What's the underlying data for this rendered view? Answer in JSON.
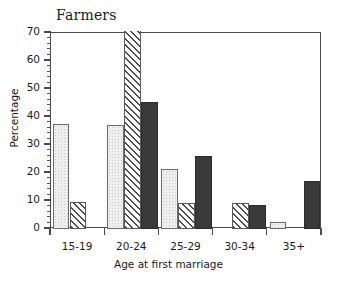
{
  "chart_data": {
    "type": "bar",
    "title": "Farmers",
    "xlabel": "Age at first marriage",
    "ylabel": "Percentage",
    "categories": [
      "15-19",
      "20-24",
      "25-29",
      "30-34",
      "35+"
    ],
    "ylim": [
      0,
      70
    ],
    "ytick_labels": [
      "0",
      "10",
      "20",
      "30",
      "40",
      "50",
      "60",
      "70"
    ],
    "ytick_values": [
      0,
      10,
      20,
      30,
      40,
      50,
      60,
      70
    ],
    "minor_tick_step": 2,
    "grid": false,
    "legend": "none",
    "series": [
      {
        "name": "series-1",
        "style": "light-stipple",
        "color": "#efefef",
        "values": [
          37.5,
          37.3,
          21.5,
          0,
          2.4
        ]
      },
      {
        "name": "series-2",
        "style": "diagonal-hatch",
        "color": "#ffffff",
        "values": [
          9.8,
          72.0,
          9.4,
          9.3,
          0
        ]
      },
      {
        "name": "series-3",
        "style": "solid-dark",
        "color": "#3a3a3a",
        "values": [
          0,
          45.2,
          26.2,
          8.5,
          17.0
        ]
      }
    ],
    "notes": {
      "clipped_bar": "20-24 diagonal-hatch bar extends above the 70 axis maximum"
    }
  }
}
